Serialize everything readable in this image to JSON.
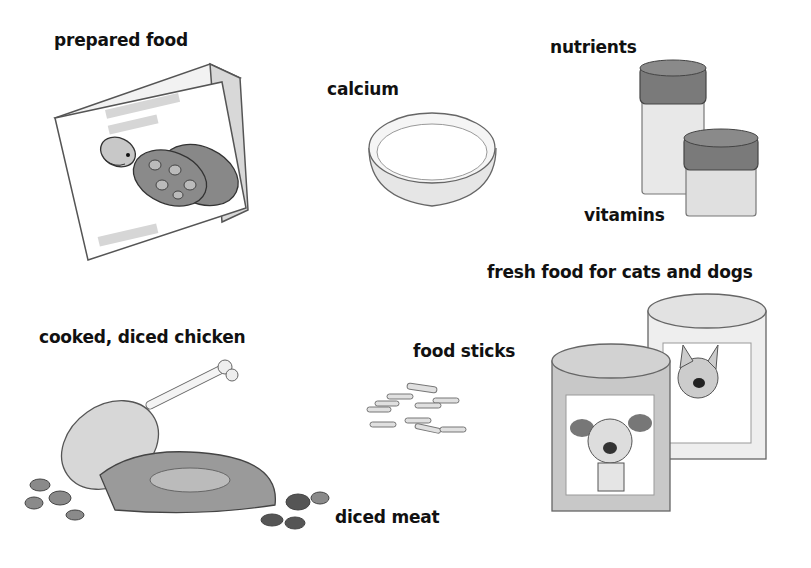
{
  "labels": {
    "prepared_food": "prepared food",
    "calcium": "calcium",
    "nutrients": "nutrients",
    "vitamins": "vitamins",
    "fresh_food": "fresh food for cats and dogs",
    "chicken": "cooked, diced chicken",
    "food_sticks": "food sticks",
    "diced_meat": "diced meat"
  },
  "illustrations": [
    {
      "name": "prepared-food-box",
      "depicts": "box with turtle picture"
    },
    {
      "name": "calcium-dish",
      "depicts": "shallow round dish"
    },
    {
      "name": "nutrient-jars",
      "depicts": "two jars with lids"
    },
    {
      "name": "pet-food-cans",
      "depicts": "two cans with dog and cat pictures"
    },
    {
      "name": "chicken-and-meat",
      "depicts": "chicken drumstick, steak and meat pieces"
    },
    {
      "name": "food-sticks",
      "depicts": "small food sticks"
    }
  ]
}
